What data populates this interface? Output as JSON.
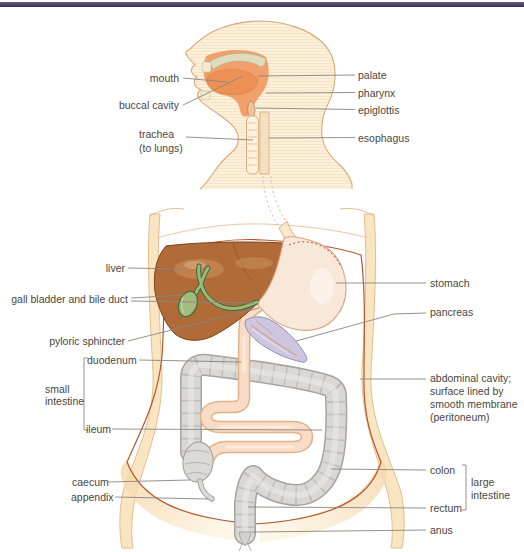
{
  "page": {
    "background": "#ffffff",
    "top_bar_color": "#4c3a5f"
  },
  "labels": {
    "mouth": "mouth",
    "buccal_cavity": "buccal cavity",
    "trachea_line1": "trachea",
    "trachea_line2": "(to lungs)",
    "palate": "palate",
    "pharynx": "pharynx",
    "epiglottis": "epiglottis",
    "esophagus": "esophagus",
    "liver": "liver",
    "gall_bladder": "gall bladder and bile duct",
    "pyloric_sphincter": "pyloric sphincter",
    "duodenum": "duodenum",
    "small_intestine_line1": "small",
    "small_intestine_line2": "intestine",
    "ileum": "ileum",
    "caecum": "caecum",
    "appendix": "appendix",
    "stomach": "stomach",
    "pancreas": "pancreas",
    "abdominal_line1": "abdominal cavity;",
    "abdominal_line2": "surface lined by",
    "abdominal_line3": "smooth membrane",
    "abdominal_line4": "(peritoneum)",
    "colon": "colon",
    "large_intestine_line1": "large",
    "large_intestine_line2": "intestine",
    "rectum": "rectum",
    "anus": "anus"
  },
  "palette": {
    "top_bar": "#4c3a5f",
    "skin": "#fae5c2",
    "skin_outline": "#e0b183",
    "head_fill": "#fdf0da",
    "mouth_orange": "#f2a06b",
    "tongue": "#ed9055",
    "palate_band": "#e0dbbd",
    "liver": "#b06b38",
    "liver_outline": "#7e4419",
    "gall_bladder": "#a3bb7e",
    "bile_duct_outline": "#3c6b36",
    "bile_duct": "#9cb878",
    "stomach": "#f8e8da",
    "stomach_outline": "#dda67c",
    "pancreas": "#cdc6de",
    "pancreas_outline": "#988dba",
    "small_intestine": "#f9dcc5",
    "small_intestine_outline": "#e2b28a",
    "colon": "#dad8d5",
    "colon_outline": "#a8a39e",
    "cavity_line": "#b5562d",
    "leader_line": "#8a867f",
    "label_text": "#4a4742",
    "groin_shade": "#f5d5a5"
  }
}
